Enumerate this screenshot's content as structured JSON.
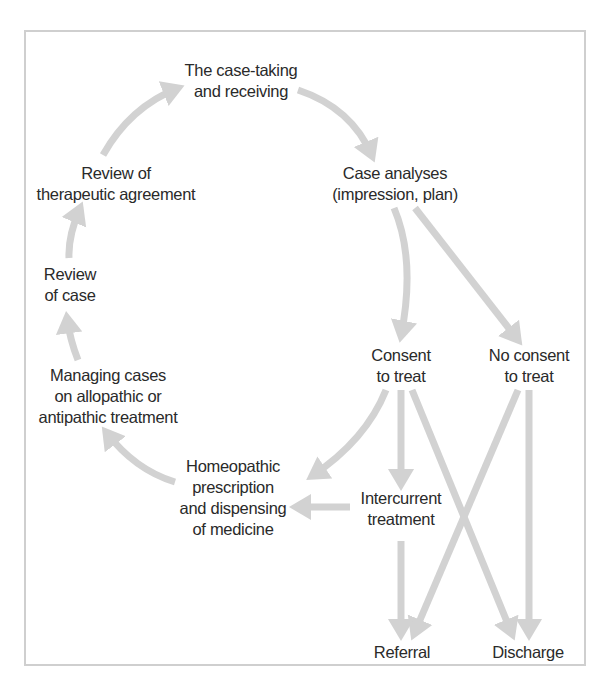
{
  "diagram": {
    "type": "flowchart",
    "arrow_color": "#d2d2d2",
    "text_color": "#2a2a2a",
    "border_color": "#cfcfcf",
    "nodes": {
      "case_taking": {
        "line1": "The case-taking",
        "line2": "and receiving"
      },
      "case_analyses": {
        "line1": "Case analyses",
        "line2": "(impression, plan)"
      },
      "consent": {
        "line1": "Consent",
        "line2": "to treat"
      },
      "no_consent": {
        "line1": "No consent",
        "line2": "to treat"
      },
      "homeopathic": {
        "line1": "Homeopathic",
        "line2": "prescription",
        "line3": "and dispensing",
        "line4": "of medicine"
      },
      "intercurrent": {
        "line1": "Intercurrent",
        "line2": "treatment"
      },
      "managing": {
        "line1": "Managing cases",
        "line2": "on allopathic or",
        "line3": "antipathic treatment"
      },
      "review_case": {
        "line1": "Review",
        "line2": "of case"
      },
      "review_agreement": {
        "line1": "Review of",
        "line2": "therapeutic agreement"
      },
      "referral": {
        "line1": "Referral"
      },
      "discharge": {
        "line1": "Discharge"
      }
    },
    "edges": [
      {
        "from": "The case-taking and receiving",
        "to": "Case analyses (impression, plan)"
      },
      {
        "from": "Case analyses (impression, plan)",
        "to": "Consent to treat"
      },
      {
        "from": "Case analyses (impression, plan)",
        "to": "No consent to treat"
      },
      {
        "from": "Consent to treat",
        "to": "Homeopathic prescription and dispensing of medicine"
      },
      {
        "from": "Consent to treat",
        "to": "Intercurrent treatment"
      },
      {
        "from": "Consent to treat",
        "to": "Discharge"
      },
      {
        "from": "No consent to treat",
        "to": "Referral"
      },
      {
        "from": "No consent to treat",
        "to": "Discharge"
      },
      {
        "from": "Intercurrent treatment",
        "to": "Homeopathic prescription and dispensing of medicine"
      },
      {
        "from": "Intercurrent treatment",
        "to": "Referral"
      },
      {
        "from": "Homeopathic prescription and dispensing of medicine",
        "to": "Managing cases on allopathic or antipathic treatment"
      },
      {
        "from": "Managing cases on allopathic or antipathic treatment",
        "to": "Review of case"
      },
      {
        "from": "Review of case",
        "to": "Review of therapeutic agreement"
      },
      {
        "from": "Review of therapeutic agreement",
        "to": "The case-taking and receiving"
      }
    ]
  }
}
